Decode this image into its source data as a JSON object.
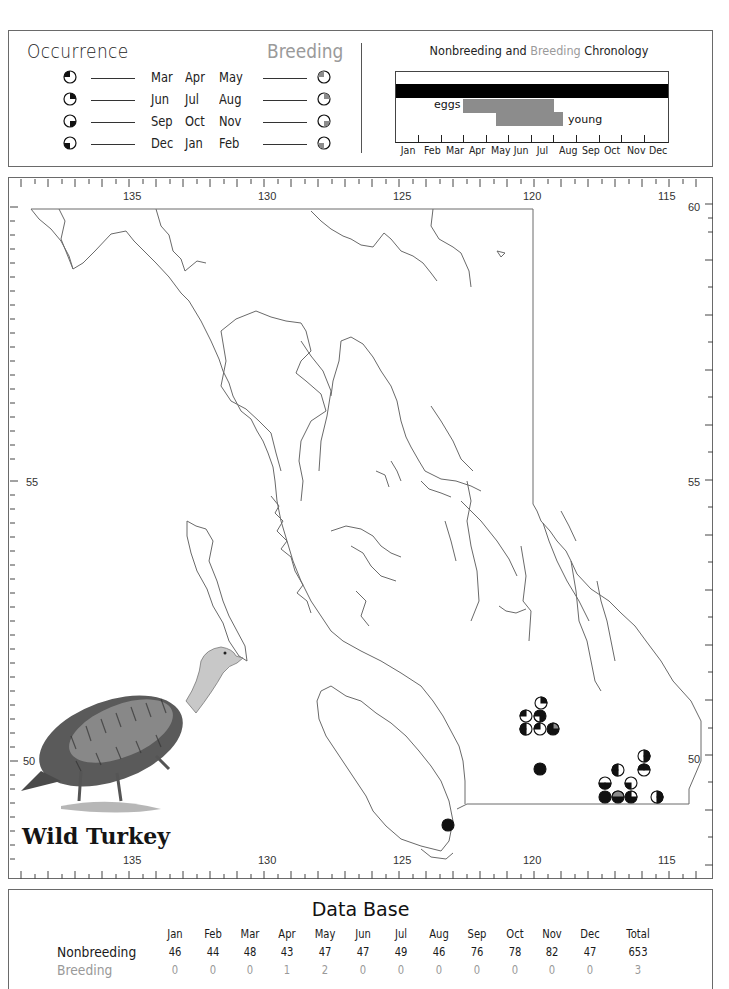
{
  "legend": {
    "occurrence_title": "Occurrence",
    "breeding_title": "Breeding",
    "rows": [
      {
        "months": [
          "Mar",
          "Apr",
          "May"
        ],
        "quadrant": "top-left",
        "occurrence_icon": "pie-quarter-nw-icon",
        "breeding_icon": "pie-quarter-nw-gray-icon"
      },
      {
        "months": [
          "Jun",
          "Jul",
          "Aug"
        ],
        "quadrant": "top-right",
        "occurrence_icon": "pie-quarter-ne-icon",
        "breeding_icon": "pie-quarter-ne-gray-icon"
      },
      {
        "months": [
          "Sep",
          "Oct",
          "Nov"
        ],
        "quadrant": "bottom-right",
        "occurrence_icon": "pie-quarter-se-icon",
        "breeding_icon": "pie-quarter-se-gray-icon"
      },
      {
        "months": [
          "Dec",
          "Jan",
          "Feb"
        ],
        "quadrant": "bottom-left",
        "occurrence_icon": "pie-quarter-sw-icon",
        "breeding_icon": "pie-quarter-sw-gray-icon"
      }
    ],
    "colors": {
      "occurrence_fill": "#111111",
      "breeding_fill": "#8c8c8c"
    }
  },
  "chronology": {
    "title_prefix": "Nonbreeding",
    "title_and": "and",
    "title_breeding": "Breeding",
    "title_suffix": "Chronology",
    "months": [
      "Jan",
      "Feb",
      "Mar",
      "Apr",
      "May",
      "Jun",
      "Jul",
      "Aug",
      "Sep",
      "Oct",
      "Nov",
      "Dec"
    ],
    "bars": [
      {
        "name": "nonbreeding",
        "label": "",
        "start_month": 0.0,
        "end_month": 12.0,
        "color": "#000000"
      },
      {
        "name": "eggs",
        "label": "eggs",
        "start_month": 2.95,
        "end_month": 6.95,
        "color": "#8c8c8c"
      },
      {
        "name": "young",
        "label": "young",
        "start_month": 4.45,
        "end_month": 7.45,
        "color": "#8c8c8c"
      }
    ]
  },
  "map": {
    "longitude_labels": [
      "135",
      "130",
      "125",
      "120",
      "115"
    ],
    "latitude_labels_left": [
      "55",
      "50"
    ],
    "latitude_labels_right": [
      "60",
      "55",
      "50"
    ],
    "species_name": "Wild Turkey",
    "illustration": "wild-turkey-illustration",
    "records": [
      {
        "x": 530,
        "y": 522,
        "quarters": [
          "ne"
        ]
      },
      {
        "x": 519,
        "y": 537,
        "quarters": [
          "nw"
        ]
      },
      {
        "x": 539,
        "y": 537,
        "quarters": [
          "ne",
          "nw"
        ]
      },
      {
        "x": 519,
        "y": 551,
        "quarters": [
          "sw"
        ]
      },
      {
        "x": 539,
        "y": 551,
        "quarters": [
          "nw"
        ]
      },
      {
        "x": 554,
        "y": 551,
        "quarters": [
          "nw",
          "sw",
          "se",
          "ne_gray"
        ]
      },
      {
        "x": 530,
        "y": 565,
        "quarters": [
          "full"
        ]
      },
      {
        "x": 637,
        "y": 587,
        "quarters": [
          "ne"
        ]
      },
      {
        "x": 636,
        "y": 602,
        "quarters": [
          "nw"
        ]
      },
      {
        "x": 609,
        "y": 575,
        "quarters": [
          "sw"
        ]
      },
      {
        "x": 597,
        "y": 617,
        "quarters": [
          "sw"
        ]
      },
      {
        "x": 596,
        "y": 631,
        "quarters": [
          "full"
        ]
      },
      {
        "x": 609,
        "y": 631,
        "quarters": [
          "full_gray_top"
        ]
      },
      {
        "x": 623,
        "y": 617,
        "quarters": [
          "sw"
        ]
      },
      {
        "x": 623,
        "y": 631,
        "quarters": [
          "sw",
          "se",
          "nw"
        ]
      },
      {
        "x": 650,
        "y": 630,
        "quarters": [
          "se"
        ]
      },
      {
        "x": 439,
        "y": 647,
        "quarters": [
          "full"
        ]
      }
    ]
  },
  "database": {
    "title": "Data Base",
    "columns": [
      "Jan",
      "Feb",
      "Mar",
      "Apr",
      "May",
      "Jun",
      "Jul",
      "Aug",
      "Sep",
      "Oct",
      "Nov",
      "Dec",
      "Total"
    ],
    "rows": [
      {
        "label": "Nonbreeding",
        "values": [
          "46",
          "44",
          "48",
          "43",
          "47",
          "47",
          "49",
          "46",
          "76",
          "78",
          "82",
          "47",
          "653"
        ]
      },
      {
        "label": "Breeding",
        "values": [
          "0",
          "0",
          "0",
          "1",
          "2",
          "0",
          "0",
          "0",
          "0",
          "0",
          "0",
          "0",
          "3"
        ]
      }
    ]
  }
}
